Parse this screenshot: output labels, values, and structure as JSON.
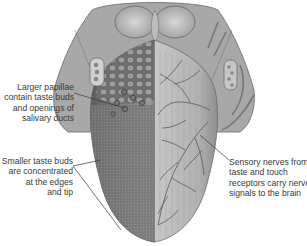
{
  "figure": {
    "colors": {
      "tongue_left": "#7d7d7d",
      "tongue_right": "#b7b7b7",
      "nerve": "#5a5a5a",
      "label_text": "#3a3a3a",
      "leader_line": "#3a3a3a"
    }
  },
  "labels": {
    "papillae": {
      "lines": [
        "Larger papillae",
        "contain taste buds",
        "and openings of",
        "salivary ducts"
      ]
    },
    "taste_buds": {
      "lines": [
        "Smaller taste buds",
        "are concentrated",
        "at the edges",
        "and tip"
      ]
    },
    "nerves": {
      "lines": [
        "Sensory nerves from",
        "taste and touch",
        "receptors carry nerve",
        "signals to the brain"
      ]
    }
  }
}
